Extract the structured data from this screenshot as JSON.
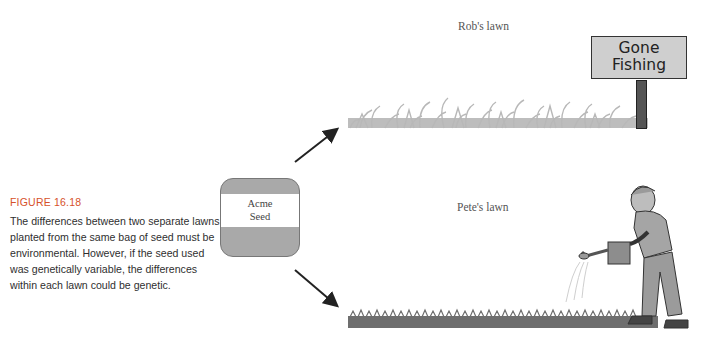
{
  "caption": {
    "figure_number": "FIGURE 16.18",
    "text": "The differences between two separate lawns planted from the same bag of seed must be environmental. However, if the seed used was genetically variable, the differences within each lawn could be genetic."
  },
  "seed_bag": {
    "line1": "Acme",
    "line2": "Seed"
  },
  "lawns": [
    {
      "label": "Rob's lawn",
      "grass_color": "#b8b8b8",
      "condition": "uneven, tall patchy grass"
    },
    {
      "label": "Pete's lawn",
      "grass_color": "#6e6e6e",
      "condition": "even, short dense grass"
    }
  ],
  "sign": {
    "line1": "Gone",
    "line2": "Fishing"
  },
  "colors": {
    "figure_title": "#d6512a",
    "bag_band": "#a9a9a9",
    "arrow": "#222222"
  }
}
